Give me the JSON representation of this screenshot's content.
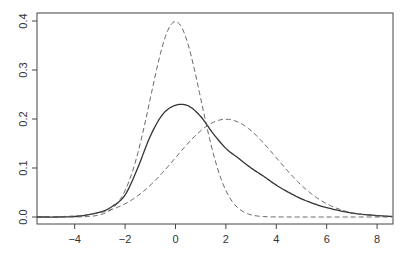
{
  "chart_data": {
    "type": "line",
    "title": "",
    "xlabel": "",
    "ylabel": "",
    "xlim": [
      -5.5,
      8.6
    ],
    "ylim": [
      0.0,
      0.4
    ],
    "grid": false,
    "legend": null,
    "x_ticks": [
      -4,
      -2,
      0,
      2,
      4,
      6,
      8
    ],
    "x_tick_labels": [
      "−4",
      "−2",
      "0",
      "2",
      "4",
      "6",
      "8"
    ],
    "y_ticks": [
      0.0,
      0.1,
      0.2,
      0.3,
      0.4
    ],
    "y_tick_labels": [
      "0.0",
      "0.1",
      "0.2",
      "0.3",
      "0.4"
    ],
    "series": [
      {
        "name": "density (solid)",
        "style": "solid",
        "color": "#333333",
        "x": [
          -5.5,
          -4,
          -3,
          -2.5,
          -2,
          -1.5,
          -1,
          -0.5,
          0,
          0.5,
          1,
          1.5,
          2,
          2.5,
          3,
          3.5,
          4,
          4.5,
          5,
          5.5,
          6,
          7,
          8,
          8.6
        ],
        "y": [
          0.0,
          0.001,
          0.01,
          0.022,
          0.045,
          0.1,
          0.165,
          0.21,
          0.228,
          0.227,
          0.205,
          0.17,
          0.14,
          0.12,
          0.1,
          0.083,
          0.065,
          0.05,
          0.037,
          0.027,
          0.019,
          0.008,
          0.003,
          0.001
        ]
      },
      {
        "name": "N(0,1) (dashed)",
        "style": "dashed",
        "color": "#555555",
        "function": "normal",
        "mean": 0,
        "sd": 1
      },
      {
        "name": "N(2,2) (dashed)",
        "style": "dashed",
        "color": "#555555",
        "function": "normal",
        "mean": 2,
        "sd": 2
      }
    ]
  }
}
